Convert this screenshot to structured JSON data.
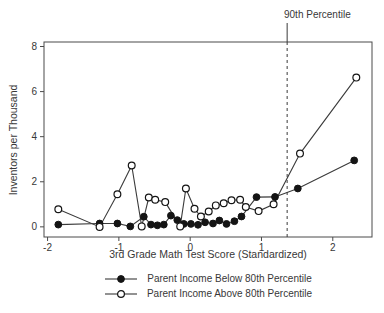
{
  "figure": {
    "annotation_label": "90th Percentile",
    "xlabel": "3rd Grade Math Test Score (Standardized)",
    "ylabel": "Inventors per Thousand",
    "line_color": "#3a3a3a",
    "marker_fill_below": "#141414",
    "marker_fill_above": "#ffffff",
    "frame_color": "#4a4a4a",
    "background": "#ffffff"
  },
  "chart_data": {
    "type": "line",
    "title": "",
    "xlabel": "3rd Grade Math Test Score (Standardized)",
    "ylabel": "Inventors per Thousand",
    "xlim": [
      -2.05,
      2.55
    ],
    "ylim": [
      -0.45,
      8.2
    ],
    "x_ticks": [
      -2,
      -1,
      0,
      1,
      2
    ],
    "y_ticks": [
      0,
      2,
      4,
      6,
      8
    ],
    "grid": false,
    "legend_position": "bottom",
    "annotations": [
      {
        "type": "vline",
        "x": 1.36,
        "style": "dashed",
        "label": "90th Percentile"
      }
    ],
    "series": [
      {
        "name": "Parent Income Below 80th Percentile",
        "marker": "filled-circle",
        "points": [
          [
            -1.85,
            0.1
          ],
          [
            -1.27,
            0.15
          ],
          [
            -1.02,
            0.15
          ],
          [
            -0.84,
            0.02
          ],
          [
            -0.65,
            0.45
          ],
          [
            -0.55,
            0.1
          ],
          [
            -0.46,
            0.07
          ],
          [
            -0.37,
            0.1
          ],
          [
            -0.27,
            0.5
          ],
          [
            -0.18,
            0.3
          ],
          [
            -0.09,
            0.13
          ],
          [
            0.01,
            0.13
          ],
          [
            0.11,
            0.09
          ],
          [
            0.21,
            0.2
          ],
          [
            0.32,
            0.15
          ],
          [
            0.41,
            0.28
          ],
          [
            0.51,
            0.13
          ],
          [
            0.62,
            0.25
          ],
          [
            0.72,
            0.46
          ],
          [
            0.93,
            1.32
          ],
          [
            1.19,
            1.33
          ],
          [
            1.51,
            1.7
          ],
          [
            2.3,
            2.95
          ]
        ]
      },
      {
        "name": "Parent Income Above 80th Percentile",
        "marker": "open-circle",
        "points": [
          [
            -1.85,
            0.78
          ],
          [
            -1.27,
            0.0
          ],
          [
            -1.02,
            1.45
          ],
          [
            -0.82,
            2.72
          ],
          [
            -0.68,
            0.02
          ],
          [
            -0.58,
            1.3
          ],
          [
            -0.49,
            1.2
          ],
          [
            -0.35,
            1.1
          ],
          [
            -0.14,
            0.02
          ],
          [
            -0.06,
            1.7
          ],
          [
            0.06,
            0.8
          ],
          [
            0.15,
            0.46
          ],
          [
            0.26,
            0.68
          ],
          [
            0.36,
            0.95
          ],
          [
            0.47,
            1.05
          ],
          [
            0.58,
            1.18
          ],
          [
            0.7,
            1.2
          ],
          [
            0.78,
            0.88
          ],
          [
            0.96,
            0.7
          ],
          [
            1.17,
            1.0
          ],
          [
            1.54,
            3.25
          ],
          [
            2.33,
            6.62
          ]
        ]
      }
    ]
  }
}
